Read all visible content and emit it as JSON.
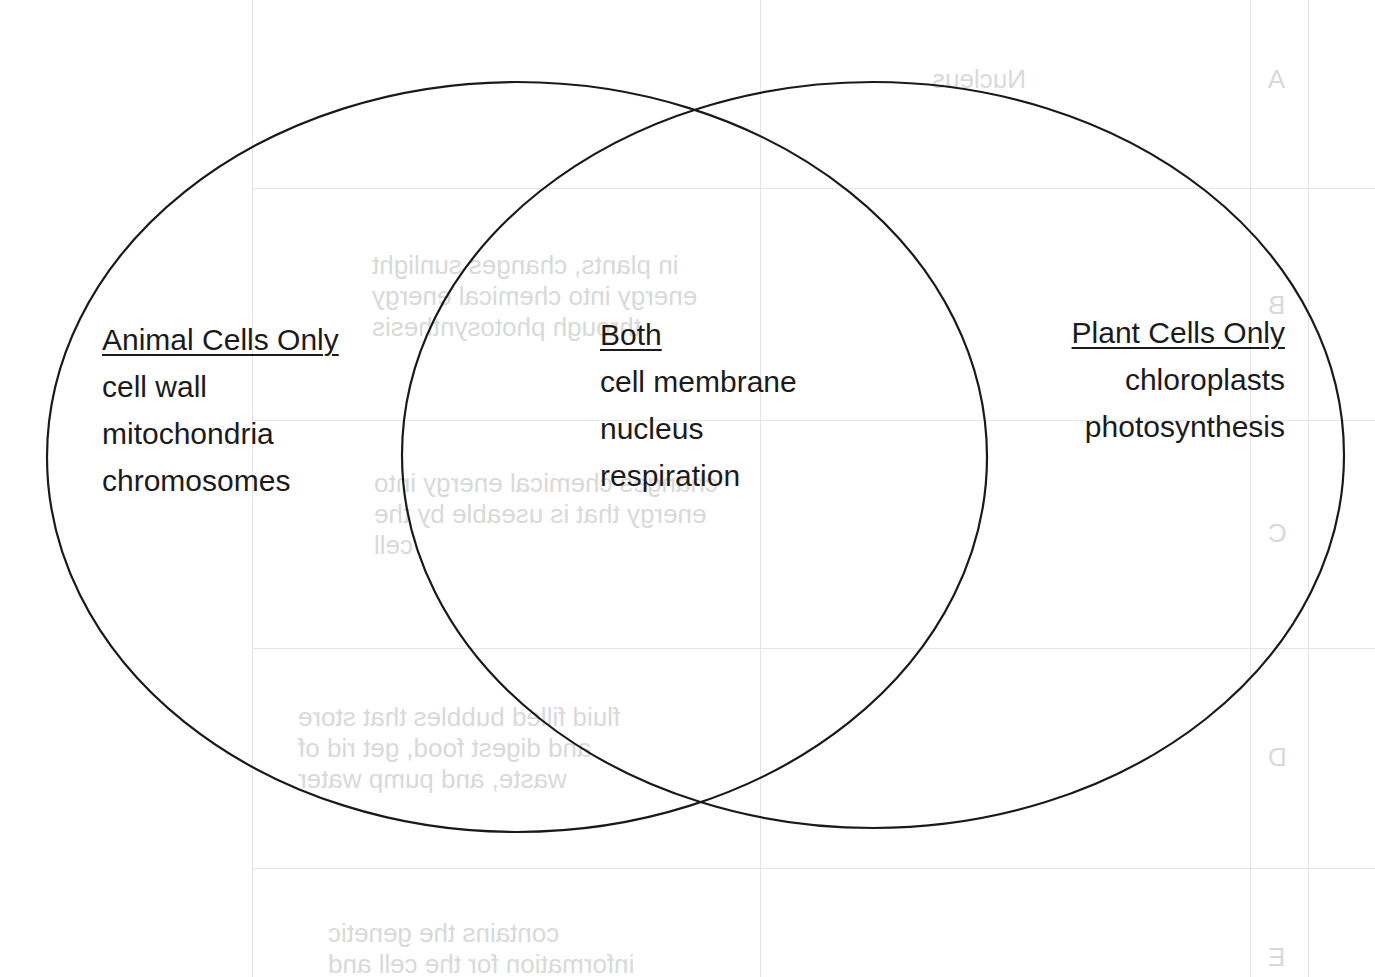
{
  "diagram": {
    "type": "venn",
    "sets": [
      {
        "id": "animal",
        "heading": "Animal Cells Only",
        "items": [
          "cell wall",
          "mitochondria",
          "chromosomes"
        ],
        "ellipse": {
          "cx": 517,
          "cy": 457,
          "rx": 470,
          "ry": 375
        }
      },
      {
        "id": "plant",
        "heading": "Plant Cells Only",
        "items": [
          "chloroplasts",
          "photosynthesis"
        ],
        "ellipse": {
          "cx": 873,
          "cy": 455,
          "rx": 471,
          "ry": 373
        }
      }
    ],
    "intersection": {
      "heading": "Both",
      "items": [
        "cell membrane",
        "nucleus",
        "respiration"
      ]
    },
    "stroke_color": "#1a1a1a",
    "background": "#ffffff"
  },
  "bleed_through": {
    "rows": [
      {
        "letter": "A",
        "term": "Nucleus",
        "definition": ""
      },
      {
        "letter": "B",
        "term": "",
        "definition": "in plants, changes sunlight\nenergy into chemical energy\nthrough photosynthesis"
      },
      {
        "letter": "C",
        "term": "",
        "definition": "changes chemical energy into\nenergy that is useable by the\ncell"
      },
      {
        "letter": "D",
        "term": "",
        "definition": "fluid filled bubbles that store\nand digest food, get rid of\nwaste, and pump water"
      },
      {
        "letter": "E",
        "term": "",
        "definition": "contains the genetic\ninformation for the cell and"
      }
    ]
  }
}
